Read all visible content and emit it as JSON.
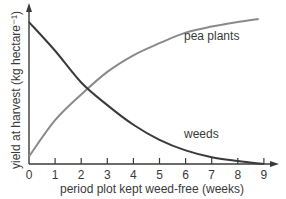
{
  "chart_data": {
    "type": "line",
    "title": "",
    "xlabel": "period plot kept weed-free (weeks)",
    "ylabel": "yield at harvest (kg hectare⁻¹)",
    "x_ticks": [
      0,
      1,
      2,
      3,
      4,
      5,
      6,
      7,
      8,
      9
    ],
    "xlim": [
      0,
      9.4
    ],
    "ylim": [
      0,
      10.5
    ],
    "y_ticks": [],
    "y_units_note": "no numeric y ticks shown; values are relative (0-10 scale)",
    "grid": false,
    "legend": "inline labels",
    "series": [
      {
        "name": "pea plants",
        "color": "#8a8a8a",
        "x": [
          0,
          1,
          2,
          3,
          4,
          5,
          6,
          7,
          8,
          8.8
        ],
        "values": [
          0.5,
          2.9,
          4.6,
          6.1,
          7.2,
          8.0,
          8.7,
          9.1,
          9.4,
          9.6
        ],
        "label_position": {
          "x": 6.4,
          "y": 8.2
        }
      },
      {
        "name": "weeds",
        "color": "#3a3a3a",
        "x": [
          0,
          1,
          2,
          3,
          4,
          5,
          6,
          7,
          8,
          9
        ],
        "values": [
          9.4,
          7.5,
          5.4,
          3.9,
          2.6,
          1.6,
          0.9,
          0.45,
          0.2,
          0.0
        ],
        "label_position": {
          "x": 6.3,
          "y": 1.7
        }
      }
    ],
    "annotations": []
  },
  "labels": {
    "xlabel": "period plot kept weed-free (weeks)",
    "ylabel": "yield at harvest (kg hectare⁻¹)",
    "pea": "pea plants",
    "weeds": "weeds",
    "ticks": [
      "0",
      "1",
      "2",
      "3",
      "4",
      "5",
      "6",
      "7",
      "8",
      "9"
    ]
  }
}
